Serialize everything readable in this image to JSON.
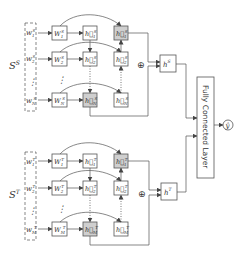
{
  "diagram": {
    "source_group": {
      "label": "S",
      "label_sup": "S",
      "inputs": [
        {
          "base": "w",
          "sub": "1",
          "sup": "S"
        },
        {
          "base": "w",
          "sub": "2",
          "sup": "S"
        },
        {
          "base": "w",
          "sub": "N",
          "sup": "S"
        }
      ],
      "embeddings": [
        {
          "base": "W",
          "sub": "1",
          "sup": "S"
        },
        {
          "base": "W",
          "sub": "2",
          "sup": "S"
        },
        {
          "base": "W",
          "sub": "N",
          "sup": "S"
        }
      ],
      "forward_states": [
        {
          "base": "h⃗",
          "sub": "1",
          "sup": "S"
        },
        {
          "base": "h⃗",
          "sub": "2",
          "sup": "S"
        },
        {
          "base": "h⃗",
          "sub": "N",
          "sup": "S"
        }
      ],
      "backward_states": [
        {
          "base": "h⃖",
          "sub": "1",
          "sup": "S"
        },
        {
          "base": "h⃖",
          "sub": "2",
          "sup": "S"
        },
        {
          "base": "h⃖",
          "sub": "N",
          "sup": "S"
        }
      ],
      "combine_symbol": "⊕",
      "output": {
        "base": "h",
        "sup": "S"
      }
    },
    "target_group": {
      "label": "S",
      "label_sup": "T",
      "inputs": [
        {
          "base": "w",
          "sub": "1",
          "sup": "T"
        },
        {
          "base": "w",
          "sub": "2",
          "sup": "T"
        },
        {
          "base": "w",
          "sub": "M",
          "sup": "T"
        }
      ],
      "embeddings": [
        {
          "base": "W",
          "sub": "1",
          "sup": "T"
        },
        {
          "base": "W",
          "sub": "2",
          "sup": "T"
        },
        {
          "base": "W",
          "sub": "M",
          "sup": "T"
        }
      ],
      "forward_states": [
        {
          "base": "h⃗",
          "sub": "1",
          "sup": "T"
        },
        {
          "base": "h⃗",
          "sub": "2",
          "sup": "T"
        },
        {
          "base": "h⃗",
          "sub": "M",
          "sup": "T"
        }
      ],
      "backward_states": [
        {
          "base": "h⃖",
          "sub": "1",
          "sup": "T"
        },
        {
          "base": "h⃖",
          "sub": "2",
          "sup": "T"
        },
        {
          "base": "h⃖",
          "sub": "M",
          "sup": "T"
        }
      ],
      "combine_symbol": "⊕",
      "output": {
        "base": "h",
        "sup": "T"
      }
    },
    "fc_layer_label": "Fully Connected Layer",
    "prediction": "ŷ",
    "ellipsis": "⋮",
    "colors": {
      "stroke": "#555555",
      "shaded_fill": "#cfcfcf",
      "background": "#ffffff"
    }
  }
}
